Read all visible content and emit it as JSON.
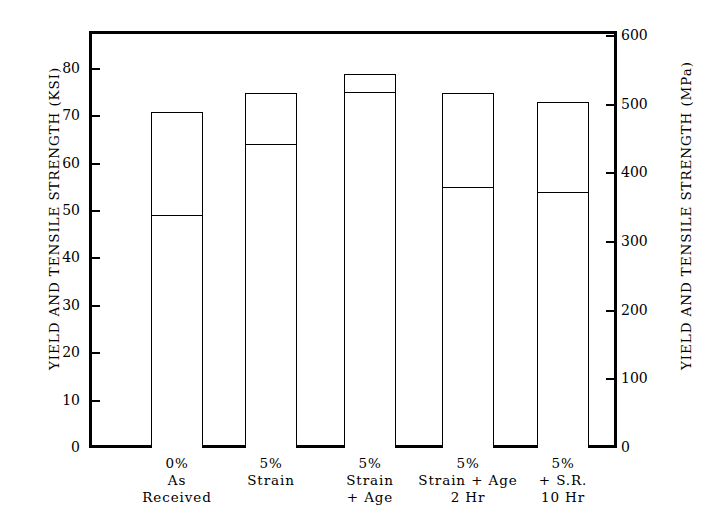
{
  "chart_data": {
    "type": "bar",
    "title": "",
    "subtitle": "",
    "categories": [
      "0% As Received",
      "5% Strain",
      "5% Strain + Age",
      "5% Strain + Age 2 Hr",
      "5% + S.R. 10 Hr"
    ],
    "category_lines": [
      [
        "0%",
        "As",
        "Received"
      ],
      [
        "5%",
        "Strain",
        ""
      ],
      [
        "5%",
        "Strain",
        "+ Age"
      ],
      [
        "5%",
        "Strain + Age",
        "2 Hr"
      ],
      [
        "5%",
        "+ S.R.",
        "10 Hr"
      ]
    ],
    "series": [
      {
        "name": "Yield Strength (KSI)",
        "values": [
          49,
          64,
          75,
          55,
          54
        ]
      },
      {
        "name": "Tensile Strength (KSI)",
        "values": [
          71,
          75,
          79,
          75,
          73
        ]
      }
    ],
    "xlabel": "",
    "ylabel": "YIELD AND TENSILE STRENGTH  (KSI)",
    "ylabel_secondary": "YIELD AND TENSILE STRENGTH  (MPa)",
    "ylim": [
      0,
      88
    ],
    "ylim_secondary": [
      0,
      607
    ],
    "yticks": [
      0,
      10,
      20,
      30,
      40,
      50,
      60,
      70,
      80
    ],
    "ytick_labels": [
      "0",
      "10",
      "20",
      "30",
      "40",
      "50",
      "60",
      "70",
      "80"
    ],
    "yticks_secondary": [
      0,
      100,
      200,
      300,
      400,
      500,
      600
    ],
    "ytick_labels_secondary": [
      "0",
      "100",
      "200",
      "300",
      "400",
      "500",
      "600"
    ],
    "grid": false,
    "legend": "none",
    "bar_color": "#ffffff",
    "line_color": "#000000"
  }
}
